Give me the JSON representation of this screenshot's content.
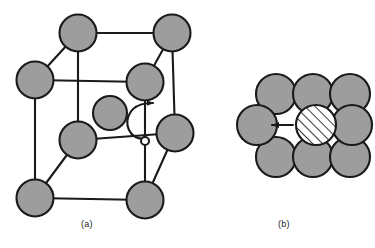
{
  "figure": {
    "background_color": "#ffffff",
    "atom_fill": "#9d9d9d",
    "atom_stroke": "#1a1a1a",
    "bond_stroke": "#1a1a1a",
    "hatch_fill": "#ffffff",
    "arrow_color": "#1a1a1a",
    "panels": [
      {
        "id": "a",
        "caption": "(a)",
        "name": "bcc-unit-cell-panel",
        "description": "body-centered cubic unit cell with interstitial site and curved migration arrow",
        "atom_radius": 18.5,
        "center_atom_radius": 17,
        "interstitial_marker_radius": 4,
        "atoms": [
          {
            "name": "corner-atom-back-top-left",
            "cx": 78,
            "cy": 33,
            "r": 18.5
          },
          {
            "name": "corner-atom-back-top-right",
            "cx": 172,
            "cy": 33,
            "r": 18.5
          },
          {
            "name": "corner-atom-front-top-left",
            "cx": 35,
            "cy": 80,
            "r": 18.5
          },
          {
            "name": "corner-atom-front-top-right",
            "cx": 145,
            "cy": 82,
            "r": 18.5
          },
          {
            "name": "corner-atom-front-mid-left",
            "cx": 78,
            "cy": 140,
            "r": 18.5
          },
          {
            "name": "corner-atom-back-bottom-right",
            "cx": 175,
            "cy": 133,
            "r": 18.5
          },
          {
            "name": "corner-atom-front-bottom-left",
            "cx": 35,
            "cy": 198,
            "r": 18.5
          },
          {
            "name": "corner-atom-front-bottom-right",
            "cx": 145,
            "cy": 200,
            "r": 18.5
          },
          {
            "name": "body-center-atom",
            "cx": 110,
            "cy": 113,
            "r": 17
          }
        ],
        "interstitial_site": {
          "name": "interstitial-site-marker",
          "cx": 145,
          "cy": 141,
          "r": 4
        },
        "migration_arrow": {
          "name": "curved-migration-arrow",
          "from": "interstitial site",
          "to": "adjacent interstitial site"
        }
      },
      {
        "id": "b",
        "caption": "(b)",
        "name": "close-packed-plane-panel",
        "description": "close-packed plane of host atoms with hatched interstitial atom and straight migration arrow",
        "atom_radius": 20,
        "atoms": [
          {
            "name": "host-atom-top-left",
            "cx": 276,
            "cy": 94,
            "r": 20
          },
          {
            "name": "host-atom-top-center",
            "cx": 313,
            "cy": 94,
            "r": 20
          },
          {
            "name": "host-atom-top-right",
            "cx": 350,
            "cy": 94,
            "r": 20
          },
          {
            "name": "host-atom-middle-left",
            "cx": 257,
            "cy": 125,
            "r": 20
          },
          {
            "name": "host-atom-middle-right",
            "cx": 352,
            "cy": 125,
            "r": 20
          },
          {
            "name": "host-atom-bottom-left",
            "cx": 276,
            "cy": 157,
            "r": 20
          },
          {
            "name": "host-atom-bottom-center",
            "cx": 313,
            "cy": 157,
            "r": 20
          },
          {
            "name": "host-atom-bottom-right",
            "cx": 350,
            "cy": 157,
            "r": 20
          }
        ],
        "interstitial_atom": {
          "name": "hatched-interstitial-atom",
          "cx": 316,
          "cy": 125,
          "r": 20,
          "pattern": "diagonal-hatch"
        },
        "migration_arrow": {
          "name": "straight-migration-arrow",
          "direction": "left",
          "x_start": 292,
          "x_end": 271,
          "y": 125
        }
      }
    ]
  }
}
